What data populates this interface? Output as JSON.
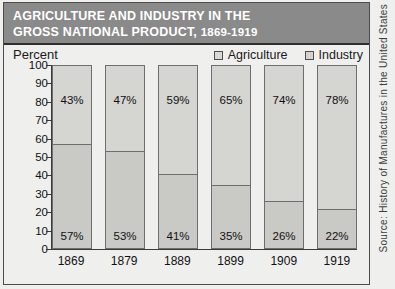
{
  "header": {
    "title_line1": "AGRICULTURE AND INDUSTRY IN THE",
    "title_line2": "GROSS NATIONAL PRODUCT,",
    "title_years": "1869-1919"
  },
  "axis_unit_label": "Percent",
  "legend": {
    "items": [
      {
        "label": "Agriculture",
        "swatch": "agriculture-swatch"
      },
      {
        "label": "Industry",
        "swatch": "industry-swatch"
      }
    ]
  },
  "source": {
    "text": "Source: History of Manufactures in the United States"
  },
  "colors": {
    "header_background": "#8a8a8a",
    "header_text": "#ffffff",
    "page_background": "#efefee",
    "agriculture_fill": "#c9c9c6",
    "industry_fill": "#d5d5d2",
    "bar_outline": "#6e6e6e",
    "axis": "#3a3a3a"
  },
  "chart_data": {
    "type": "bar",
    "stacked": true,
    "title": "AGRICULTURE AND INDUSTRY IN THE GROSS NATIONAL PRODUCT, 1869-1919",
    "xlabel": "",
    "ylabel": "Percent",
    "ylim": [
      0,
      100
    ],
    "yticks": [
      0,
      10,
      20,
      30,
      40,
      50,
      60,
      70,
      80,
      90,
      100
    ],
    "ytick_labels": [
      "0",
      "10",
      "20",
      "30",
      "40",
      "50",
      "60",
      "70",
      "80",
      "90",
      "100"
    ],
    "grid": false,
    "legend_position": "top-right",
    "categories": [
      "1869",
      "1879",
      "1889",
      "1899",
      "1909",
      "1919"
    ],
    "series": [
      {
        "name": "Agriculture",
        "values": [
          57,
          53,
          41,
          35,
          26,
          22
        ],
        "labels": [
          "57%",
          "53%",
          "41%",
          "35%",
          "26%",
          "22%"
        ]
      },
      {
        "name": "Industry",
        "values": [
          43,
          47,
          59,
          65,
          74,
          78
        ],
        "labels": [
          "43%",
          "47%",
          "59%",
          "65%",
          "74%",
          "78%"
        ]
      }
    ]
  }
}
